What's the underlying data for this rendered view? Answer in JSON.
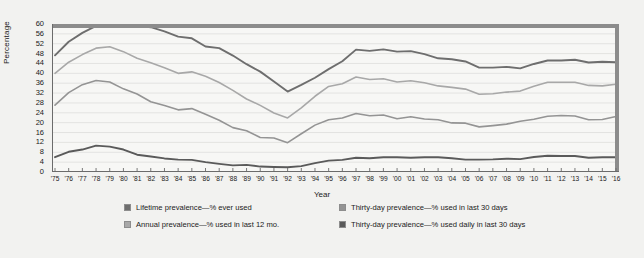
{
  "chart_data": {
    "type": "line",
    "title": "",
    "xlabel": "Year",
    "ylabel": "Percentage",
    "ylim": [
      0,
      60
    ],
    "ytick_step": 4,
    "grid": true,
    "legend_position": "bottom",
    "yticks": [
      60,
      56,
      52,
      48,
      44,
      40,
      36,
      32,
      28,
      24,
      20,
      16,
      12,
      8,
      4,
      0
    ],
    "categories": [
      "'75",
      "'76",
      "'77",
      "'78",
      "'79",
      "'80",
      "'81",
      "'82",
      "'83",
      "'84",
      "'85",
      "'86",
      "'87",
      "'88",
      "'89",
      "'90",
      "'91",
      "'92",
      "'93",
      "'94",
      "'95",
      "'96",
      "'97",
      "'98",
      "'99",
      "'00",
      "'01",
      "'02",
      "'03",
      "'04",
      "'05",
      "'06",
      "'07",
      "'08",
      "'09",
      "'10",
      "'11",
      "'12",
      "'13",
      "'14",
      "'15",
      "'16"
    ],
    "series": [
      {
        "name": "Lifetime prevalence—% ever used",
        "color": "#6e6e6e",
        "values": [
          47.3,
          52.8,
          56.4,
          59.2,
          60.4,
          60.3,
          59.5,
          58.7,
          57.0,
          54.9,
          54.2,
          50.9,
          50.2,
          47.2,
          43.7,
          40.7,
          36.7,
          32.6,
          35.3,
          38.2,
          41.7,
          44.9,
          49.6,
          49.1,
          49.7,
          48.8,
          49.0,
          47.8,
          46.1,
          45.7,
          44.8,
          42.3,
          42.3,
          42.6,
          42.0,
          43.8,
          45.2,
          45.2,
          45.5,
          44.4,
          44.7,
          44.5
        ]
      },
      {
        "name": "Annual prevalence—% used in last 12 mo.",
        "color": "#a8a8a8",
        "values": [
          40.0,
          44.5,
          47.6,
          50.2,
          50.8,
          48.8,
          46.1,
          44.3,
          42.3,
          40.0,
          40.6,
          38.8,
          36.3,
          33.1,
          29.6,
          27.0,
          23.9,
          21.9,
          26.0,
          30.7,
          34.7,
          35.8,
          38.5,
          37.5,
          37.8,
          36.5,
          37.0,
          36.2,
          34.9,
          34.3,
          33.6,
          31.5,
          31.7,
          32.4,
          32.8,
          34.8,
          36.4,
          36.4,
          36.4,
          35.1,
          34.9,
          35.6
        ]
      },
      {
        "name": "Thirty-day prevalence—% used in last 30 days",
        "color": "#949494",
        "values": [
          27.1,
          32.2,
          35.4,
          37.1,
          36.5,
          33.7,
          31.6,
          28.5,
          27.0,
          25.2,
          25.7,
          23.4,
          21.0,
          18.0,
          16.7,
          14.0,
          13.8,
          11.9,
          15.5,
          19.0,
          21.2,
          21.9,
          23.7,
          22.8,
          23.1,
          21.6,
          22.4,
          21.5,
          21.2,
          19.9,
          19.8,
          18.3,
          18.8,
          19.4,
          20.6,
          21.4,
          22.6,
          22.9,
          22.7,
          21.2,
          21.3,
          22.5
        ]
      },
      {
        "name": "Thirty-day prevalence—% used daily in last 30 days",
        "color": "#5a5a5a",
        "values": [
          6.0,
          8.2,
          9.1,
          10.7,
          10.3,
          9.1,
          7.0,
          6.3,
          5.5,
          5.0,
          4.9,
          4.0,
          3.3,
          2.7,
          2.9,
          2.2,
          2.0,
          1.9,
          2.4,
          3.6,
          4.6,
          4.9,
          5.8,
          5.6,
          6.0,
          6.0,
          5.8,
          6.0,
          6.0,
          5.6,
          5.0,
          5.0,
          5.1,
          5.4,
          5.2,
          6.1,
          6.6,
          6.5,
          6.5,
          5.8,
          6.0,
          6.0
        ]
      }
    ]
  },
  "legend": {
    "entries": [
      {
        "label": "Lifetime prevalence—% ever used",
        "color": "#6e6e6e"
      },
      {
        "label": "Thirty-day prevalence—% used in last 30 days",
        "color": "#949494"
      },
      {
        "label": "Annual prevalence—% used in last 12 mo.",
        "color": "#a8a8a8"
      },
      {
        "label": "Thirty-day prevalence—% used daily in last 30 days",
        "color": "#5a5a5a"
      }
    ]
  },
  "style": {
    "frame_color": "#8c8c8c",
    "background": "#f2f2f0",
    "gridline_color": "#e3e3e1",
    "axis_color": "#6b6b6b"
  }
}
